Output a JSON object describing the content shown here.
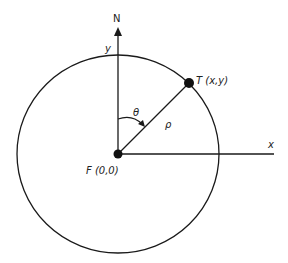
{
  "diagram": {
    "colors": {
      "stroke": "#1a1a1a",
      "text": "#222222",
      "background": "#ffffff"
    },
    "labels": {
      "north": "N",
      "y_axis": "y",
      "x_axis": "x",
      "target": "T (x,y)",
      "origin": "F (0,0)",
      "angle": "θ",
      "range": "ρ"
    },
    "geometry": {
      "circle_center": [
        118,
        154
      ],
      "circle_radius_x": 101,
      "circle_radius_y": 99,
      "target_point": [
        189,
        83
      ],
      "y_axis_top": 28,
      "x_axis_right": 274
    }
  }
}
